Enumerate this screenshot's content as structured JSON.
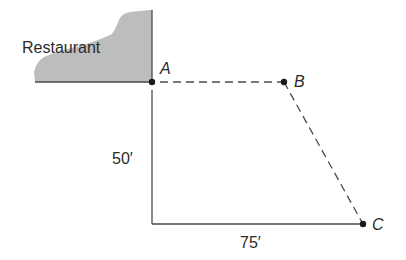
{
  "diagram": {
    "restaurant": {
      "label": "Restaurant",
      "fill": "#bdbdbd",
      "outline": [
        [
          35,
          82
        ],
        [
          34,
          70
        ],
        [
          40,
          58
        ],
        [
          56,
          52
        ],
        [
          78,
          46
        ],
        [
          98,
          38
        ],
        [
          112,
          34
        ],
        [
          118,
          24
        ],
        [
          124,
          14
        ],
        [
          148,
          10
        ],
        [
          152,
          10
        ],
        [
          152,
          82
        ]
      ]
    },
    "points": {
      "A": {
        "label": "A",
        "x": 152,
        "y": 82
      },
      "B": {
        "label": "B",
        "x": 284,
        "y": 82
      },
      "C": {
        "label": "C",
        "x": 363,
        "y": 224
      }
    },
    "measurements": {
      "vertical": {
        "label": "50′"
      },
      "horizontal": {
        "label": "75′"
      }
    },
    "colors": {
      "line": "#4a4a4a",
      "point": "#1a1a1a",
      "text": "#2b2b2b"
    }
  }
}
